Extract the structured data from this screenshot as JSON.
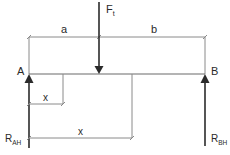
{
  "diagram": {
    "type": "beam-free-body-diagram",
    "colors": {
      "background": "#ffffff",
      "force_arrow": "#2b2b2b",
      "beam_line": "#5a5a5a",
      "dimension_line": "#8a8a8a",
      "text": "#2a2a2a"
    },
    "supports": {
      "left": {
        "label": "A",
        "reaction_main": "R",
        "reaction_sub": "AH"
      },
      "right": {
        "label": "B",
        "reaction_main": "R",
        "reaction_sub": "BH"
      }
    },
    "load": {
      "label_main": "F",
      "label_sub": "t"
    },
    "dimensions": {
      "a": "a",
      "b": "b",
      "x_short": "x",
      "x_long": "x"
    }
  }
}
